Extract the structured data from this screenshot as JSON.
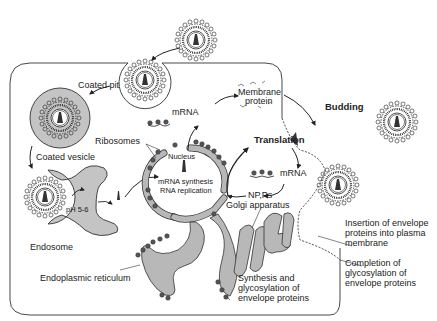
{
  "diagram": {
    "labels": {
      "coated_pit": "Coated pit",
      "coated_vesicle": "Coated vesicle",
      "endosome": "Endosome",
      "ph": "pH 5-6",
      "ribosomes": "Ribosomes",
      "nucleus": "Nucleus",
      "mrna_synthesis": "mRNA synthesis",
      "rna_replication": "RNA replication",
      "mrna_top": "mRNA",
      "membrane_protein_1": "Membrane",
      "membrane_protein_2": "protein",
      "translation": "Translation",
      "mrna_right": "mRNA",
      "npps": "NP,Ps",
      "golgi": "Golgi apparatus",
      "budding": "Budding",
      "er": "Endoplasmic reticulum",
      "synthesis_1": "Synthesis and",
      "synthesis_2": "glycosylation of",
      "synthesis_3": "envelope proteins",
      "insertion_1": "Insertion of envelope",
      "insertion_2": "proteins into plasma",
      "insertion_3": "membrane",
      "completion_1": "Completion of",
      "completion_2": "glycosylation of",
      "completion_3": "envelope proteins"
    },
    "colors": {
      "stroke": "#222222",
      "organelle_fill": "#b8b8b8",
      "vesicle_fill": "#c4c4c4",
      "background": "#ffffff"
    }
  }
}
